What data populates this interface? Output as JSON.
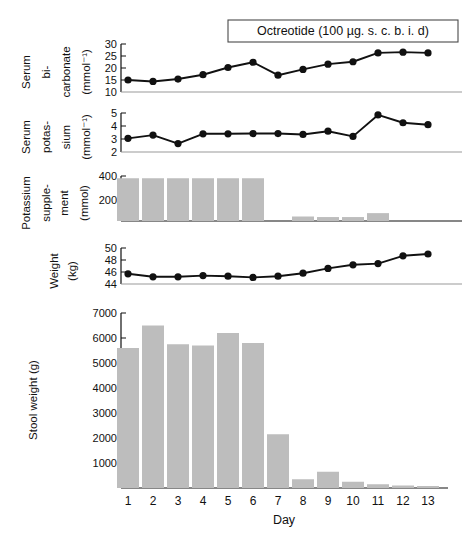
{
  "figure": {
    "treatment_label": "Octreotide (100 µg. s. c.  b. i. d)",
    "x_axis_title": "Day",
    "days": [
      "1",
      "2",
      "3",
      "4",
      "5",
      "6",
      "7",
      "8",
      "9",
      "10",
      "11",
      "12",
      "13"
    ]
  },
  "chart_data": [
    {
      "type": "line",
      "panel": "serum-bicarbonate",
      "title": "",
      "xlabel": "Day",
      "ylabel": "Serum bi-carbonate (mmol⁻¹)",
      "ylabel_lines": [
        "Serum",
        "bi-",
        "carbonate",
        "(mmol⁻¹)"
      ],
      "ylim": [
        10,
        30
      ],
      "yticks": [
        30,
        25,
        20,
        15,
        10
      ],
      "ytick_labels": [
        "30",
        "25",
        "20",
        "15",
        "10"
      ],
      "x": [
        1,
        2,
        3,
        4,
        5,
        6,
        7,
        8,
        9,
        10,
        11,
        12,
        13
      ],
      "categories": [
        "1",
        "2",
        "3",
        "4",
        "5",
        "6",
        "7",
        "8",
        "9",
        "10",
        "11",
        "12",
        "13"
      ],
      "values": [
        15.0,
        14.4,
        15.4,
        17.2,
        20.2,
        22.4,
        17.0,
        19.4,
        21.6,
        22.6,
        26.3,
        26.6,
        26.3
      ],
      "grid": false,
      "legend": "none"
    },
    {
      "type": "line",
      "panel": "serum-potassium",
      "title": "",
      "xlabel": "Day",
      "ylabel": "Serum potas-sium (mmol⁻¹)",
      "ylabel_lines": [
        "Serum",
        "potas-",
        "sium",
        "(mmol⁻¹)"
      ],
      "ylim": [
        2,
        5
      ],
      "yticks": [
        5,
        4,
        3,
        2
      ],
      "ytick_labels": [
        "5",
        "4",
        "3",
        "2"
      ],
      "x": [
        1,
        2,
        3,
        4,
        5,
        6,
        7,
        8,
        9,
        10,
        11,
        12,
        13
      ],
      "categories": [
        "1",
        "2",
        "3",
        "4",
        "5",
        "6",
        "7",
        "8",
        "9",
        "10",
        "11",
        "12",
        "13"
      ],
      "values": [
        3.05,
        3.3,
        2.65,
        3.4,
        3.4,
        3.42,
        3.42,
        3.35,
        3.6,
        3.2,
        4.85,
        4.25,
        4.1
      ],
      "grid": false,
      "legend": "none"
    },
    {
      "type": "bar",
      "panel": "potassium-supplement",
      "title": "",
      "xlabel": "Day",
      "ylabel": "Potassium supple-ment (mmol)",
      "ylabel_lines": [
        "Potassium",
        "supple-",
        "ment",
        "(mmol)"
      ],
      "ylim": [
        0,
        400
      ],
      "yticks": [
        400,
        200
      ],
      "ytick_labels": [
        "400",
        "200"
      ],
      "categories": [
        "1",
        "2",
        "3",
        "4",
        "5",
        "6",
        "7",
        "8",
        "9",
        "10",
        "11",
        "12",
        "13"
      ],
      "values": [
        380,
        380,
        380,
        380,
        380,
        380,
        0,
        40,
        35,
        35,
        70,
        0,
        0
      ],
      "grid": false,
      "legend": "none"
    },
    {
      "type": "line",
      "panel": "weight",
      "title": "",
      "xlabel": "Day",
      "ylabel": "Weight (kg)",
      "ylabel_lines": [
        "Weight",
        "(kg)"
      ],
      "ylim": [
        44,
        50
      ],
      "yticks": [
        50,
        48,
        46,
        44
      ],
      "ytick_labels": [
        "50",
        "48",
        "46",
        "44"
      ],
      "x": [
        1,
        2,
        3,
        4,
        5,
        6,
        7,
        8,
        9,
        10,
        11,
        12,
        13
      ],
      "categories": [
        "1",
        "2",
        "3",
        "4",
        "5",
        "6",
        "7",
        "8",
        "9",
        "10",
        "11",
        "12",
        "13"
      ],
      "values": [
        45.7,
        45.2,
        45.2,
        45.4,
        45.3,
        45.1,
        45.3,
        45.8,
        46.6,
        47.2,
        47.4,
        48.7,
        49.0
      ],
      "grid": false,
      "legend": "none"
    },
    {
      "type": "bar",
      "panel": "stool-weight",
      "title": "",
      "xlabel": "Day",
      "ylabel": "Stool weight (g)",
      "ylabel_lines": [
        "Stool weight (g)"
      ],
      "ylim": [
        0,
        7000
      ],
      "yticks": [
        7000,
        6000,
        5000,
        4000,
        3000,
        2000,
        1000
      ],
      "ytick_labels": [
        "7000",
        "6000",
        "5000",
        "4000",
        "3000",
        "2000",
        "1000"
      ],
      "categories": [
        "1",
        "2",
        "3",
        "4",
        "5",
        "6",
        "7",
        "8",
        "9",
        "10",
        "11",
        "12",
        "13"
      ],
      "values": [
        5600,
        6500,
        5750,
        5700,
        6200,
        5800,
        2150,
        350,
        650,
        250,
        150,
        100,
        80
      ],
      "grid": false,
      "legend": "none"
    }
  ],
  "colors": {
    "bar_fill": "#bdbdbd",
    "line": "#111111",
    "axis": "#111111",
    "baseline": "#9a9a9a",
    "box_border": "#4a4a4a",
    "background": "#ffffff"
  }
}
